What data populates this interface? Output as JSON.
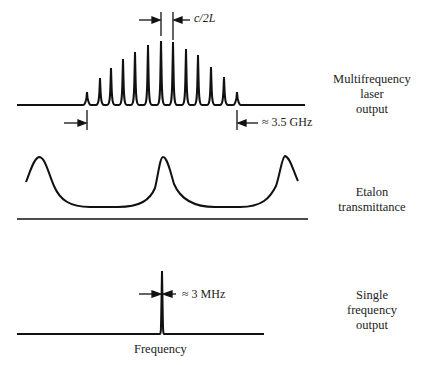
{
  "panels": [
    {
      "id": "laser",
      "label_lines": [
        "Multifrequency",
        "laser",
        "output"
      ]
    },
    {
      "id": "etalon",
      "label_lines": [
        "Etalon",
        "transmittance"
      ]
    },
    {
      "id": "single",
      "label_lines": [
        "Single",
        "frequency",
        "output"
      ]
    }
  ],
  "annotations": {
    "mode_spacing": "c/2L",
    "gain_bandwidth": "≈ 3.5 GHz",
    "linewidth": "≈ 3 MHz",
    "x_axis": "Frequency"
  },
  "laser_modes": {
    "x": [
      87,
      100,
      111,
      123,
      135,
      148,
      161,
      173,
      186,
      198,
      211,
      224,
      237
    ],
    "peak_y": [
      92,
      78,
      68,
      59,
      52,
      45,
      41,
      42,
      49,
      55,
      67,
      77,
      92
    ],
    "baseline_y": 105
  },
  "colors": {
    "ink": "#111111",
    "background": "#ffffff"
  }
}
